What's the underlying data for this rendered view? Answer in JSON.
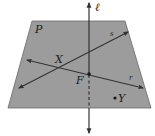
{
  "diagram": {
    "plane_label": "P",
    "line_vertical_label": "ℓ",
    "line_s_label": "s",
    "line_r_label": "r",
    "point_X_label": "X",
    "point_F_label": "F",
    "point_Y_label": "Y",
    "colors": {
      "plane_fill": "#9c9c9c",
      "plane_edge": "#6a6a6a",
      "line": "#333333",
      "background": "#ffffff"
    }
  }
}
